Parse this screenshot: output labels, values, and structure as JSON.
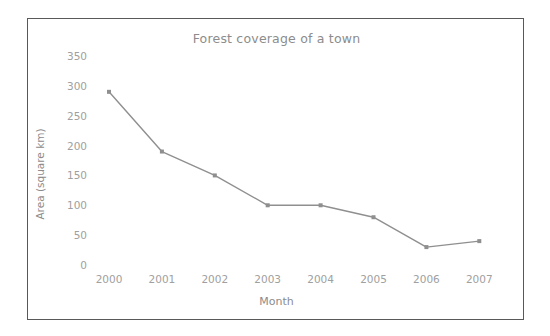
{
  "chart_data": {
    "type": "line",
    "title": "Forest coverage of a town",
    "xlabel": "Month",
    "ylabel": "Area (square km)",
    "categories": [
      "2000",
      "2001",
      "2002",
      "2003",
      "2004",
      "2005",
      "2006",
      "2007"
    ],
    "values": [
      290,
      190,
      150,
      100,
      100,
      80,
      30,
      40
    ],
    "series": [
      {
        "name": "Forest coverage",
        "values": [
          290,
          190,
          150,
          100,
          100,
          80,
          30,
          40
        ]
      }
    ],
    "ylim": [
      0,
      350
    ],
    "y_ticks": [
      "350",
      "300",
      "250",
      "200",
      "150",
      "100",
      "50",
      "0"
    ],
    "y_tick_values": [
      350,
      300,
      250,
      200,
      150,
      100,
      50,
      0
    ],
    "grid": false,
    "legend": "none",
    "marker": "square",
    "line_color": "#8f8f8f",
    "marker_color": "#8f8f8f",
    "text_color": "#a0a0a0",
    "title_color": "#8c8c8c",
    "frame_color": "#595959",
    "background_color": "#ffffff"
  }
}
